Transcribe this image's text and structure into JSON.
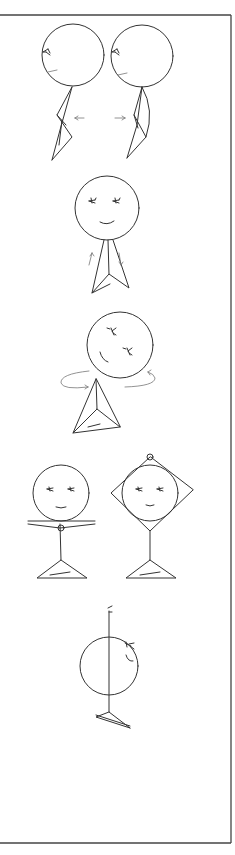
{
  "figure": {
    "frame": {
      "top": 15,
      "right": 231,
      "bottom": 843
    },
    "colors": {
      "line": "#333333",
      "arrow": "#777777",
      "frame": "#444444",
      "background": "#ffffff"
    },
    "panels": [
      {
        "id": "neck-tilt-side",
        "figures": 2,
        "arrows": [
          "left",
          "right"
        ]
      },
      {
        "id": "head-nod",
        "figures": 1,
        "arrows": [
          "up",
          "down"
        ]
      },
      {
        "id": "head-rotate",
        "figures": 1,
        "arrows": [
          "circular"
        ]
      },
      {
        "id": "arms-overhead",
        "figures": 2,
        "arrows": []
      },
      {
        "id": "side-profile-raise",
        "figures": 1,
        "arrows": []
      }
    ]
  }
}
